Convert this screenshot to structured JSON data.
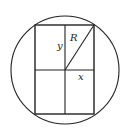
{
  "figure": {
    "stroke_color": "#222222",
    "background": "#ffffff",
    "circle": {
      "cx": 65,
      "cy": 70,
      "r": 54
    },
    "rectangle": {
      "x": 35,
      "y": 25,
      "width": 59,
      "height": 89
    },
    "center_lines": {
      "vertical_x": 65,
      "horizontal_y": 70
    },
    "diagonal": {
      "x1": 65,
      "y1": 70,
      "x2": 94,
      "y2": 25
    },
    "labels": {
      "y": {
        "text": "y",
        "x": 57,
        "y": 49
      },
      "R": {
        "text": "R",
        "x": 70,
        "y": 41
      },
      "x": {
        "text": "x",
        "x": 78,
        "y": 80
      }
    }
  }
}
